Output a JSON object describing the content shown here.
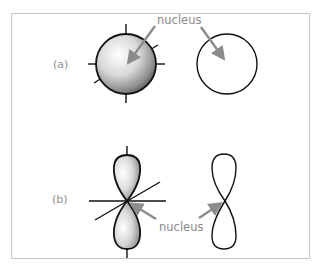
{
  "figure": {
    "panels": [
      {
        "id": "a",
        "label": "(a)",
        "left_shape": "shaded sphere with axes (s orbital, 3D)",
        "right_shape": "circle outline (s orbital, 2D)",
        "annotation": "nucleus"
      },
      {
        "id": "b",
        "label": "(b)",
        "left_shape": "shaded dumbbell with axes (p orbital, 3D)",
        "right_shape": "figure-eight outline (p orbital, 2D)",
        "annotation": "nucleus"
      }
    ],
    "colors": {
      "frame": "#c8c8c8",
      "outline": "#111111",
      "arrow": "#8c8c8c",
      "label_text": "#8f8f8f",
      "shade_light": "#ffffff",
      "shade_dark": "#5a5a5a"
    }
  }
}
